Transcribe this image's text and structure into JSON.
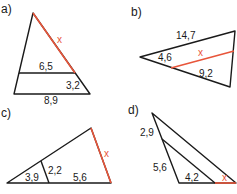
{
  "colors": {
    "line": "#1a1a1a",
    "highlight": "#e8553a",
    "background": "#ffffff"
  },
  "problems": [
    {
      "id": "a",
      "label": "a)",
      "unknown": "x",
      "measures": {
        "inner_parallel": "6,5",
        "lower_side_segment": "3,2",
        "base": "8,9"
      }
    },
    {
      "id": "b",
      "label": "b)",
      "unknown": "x",
      "measures": {
        "top_side": "14,7",
        "left_segment": "4,6",
        "lower_segment": "9,2"
      }
    },
    {
      "id": "c",
      "label": "c)",
      "unknown": "x",
      "measures": {
        "base_left_segment": "3,9",
        "inner_parallel": "2,2",
        "base_right_segment": "5,6"
      }
    },
    {
      "id": "d",
      "label": "d)",
      "unknown": "x",
      "measures": {
        "upper_left_segment": "2,9",
        "lower_left_segment": "5,6",
        "base_segment": "4,2"
      }
    }
  ]
}
